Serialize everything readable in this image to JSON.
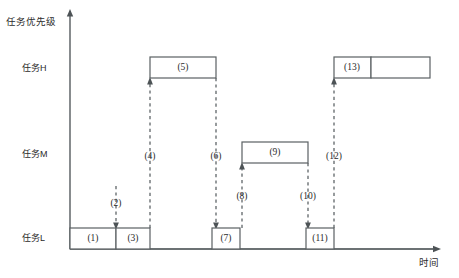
{
  "diagram": {
    "type": "priority-inversion-timing-diagram",
    "y_axis_label": "任务优先级",
    "x_axis_label": "时间",
    "levels": [
      {
        "key": "H",
        "label": "任务H",
        "y": 78
      },
      {
        "key": "M",
        "label": "任务M",
        "y": 163
      },
      {
        "key": "L",
        "label": "任务L",
        "y": 249
      }
    ],
    "execution_blocks": [
      {
        "id": "1",
        "label": "(1)",
        "level": "L",
        "x1": 70,
        "x2": 116
      },
      {
        "id": "3",
        "label": "(3)",
        "level": "L",
        "x1": 116,
        "x2": 150
      },
      {
        "id": "5",
        "label": "(5)",
        "level": "H",
        "x1": 150,
        "x2": 216
      },
      {
        "id": "7",
        "label": "(7)",
        "level": "L",
        "x1": 212,
        "x2": 240
      },
      {
        "id": "9",
        "label": "(9)",
        "level": "M",
        "x1": 242,
        "x2": 308
      },
      {
        "id": "11",
        "label": "(11)",
        "level": "L",
        "x1": 306,
        "x2": 334
      },
      {
        "id": "13",
        "label": "(13)",
        "level": "H",
        "x1": 334,
        "x2": 371
      },
      {
        "id": "14",
        "label": "",
        "level": "H",
        "x1": 371,
        "x2": 430
      }
    ],
    "event_markers": [
      {
        "id": "2",
        "label": "(2)",
        "x": 116,
        "label_y": 204,
        "dash_top": 186,
        "dash_bottom": 228,
        "arrow": "down"
      },
      {
        "id": "4",
        "label": "(4)",
        "x": 150,
        "label_y": 157,
        "dash_top": 78,
        "dash_bottom": 228,
        "arrow": "up"
      },
      {
        "id": "6",
        "label": "(6)",
        "x": 216,
        "label_y": 157,
        "dash_top": 78,
        "dash_bottom": 228,
        "arrow": "down"
      },
      {
        "id": "8",
        "label": "(8)",
        "x": 242,
        "label_y": 197,
        "dash_top": 163,
        "dash_bottom": 228,
        "arrow": "up"
      },
      {
        "id": "10",
        "label": "(10)",
        "x": 308,
        "label_y": 197,
        "dash_top": 163,
        "dash_bottom": 228,
        "arrow": "down"
      },
      {
        "id": "12",
        "label": "(12)",
        "x": 334,
        "label_y": 157,
        "dash_top": 78,
        "dash_bottom": 228,
        "arrow": "up"
      }
    ],
    "axis": {
      "origin_x": 70,
      "origin_y": 249,
      "y_top": 12,
      "x_right": 440
    },
    "colors": {
      "line": "#5a6063",
      "text": "#2b2b2b",
      "background": "#ffffff"
    }
  }
}
